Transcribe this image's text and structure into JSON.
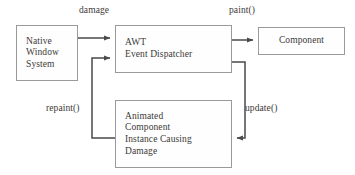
{
  "diagram": {
    "background_color": "#ffffff",
    "stroke_color": "#4a4a4a",
    "box_border_color": "#9a9a9a",
    "text_color": "#3c3a38",
    "nodes": [
      {
        "id": "native-window-system",
        "lines": [
          "Native",
          "Window",
          "System"
        ],
        "x": 16,
        "y": 25,
        "w": 62,
        "h": 56
      },
      {
        "id": "awt-event-dispatcher",
        "lines": [
          "AWT",
          "Event Dispatcher"
        ],
        "x": 115,
        "y": 25,
        "w": 117,
        "h": 48
      },
      {
        "id": "component",
        "lines": [
          "Component"
        ],
        "x": 258,
        "y": 27,
        "w": 87,
        "h": 28
      },
      {
        "id": "animated-component",
        "lines": [
          "Animated",
          "Component",
          "Instance Causing",
          "Damage"
        ],
        "x": 115,
        "y": 100,
        "w": 117,
        "h": 68
      }
    ],
    "edges": [
      {
        "id": "damage",
        "label": "damage",
        "from": "native-window-system",
        "to": "awt-event-dispatcher"
      },
      {
        "id": "paint",
        "label": "paint()",
        "from": "awt-event-dispatcher",
        "to": "component"
      },
      {
        "id": "update",
        "label": "update()",
        "from": "awt-event-dispatcher",
        "to": "animated-component"
      },
      {
        "id": "repaint",
        "label": "repaint()",
        "from": "animated-component",
        "to": "awt-event-dispatcher"
      }
    ]
  }
}
